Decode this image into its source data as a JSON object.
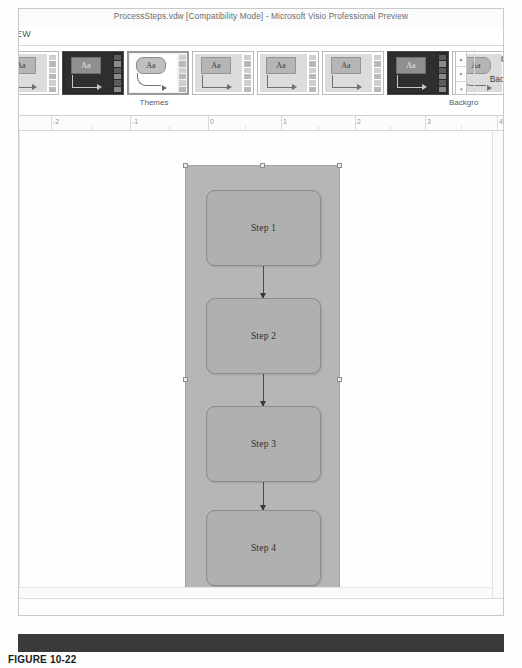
{
  "window": {
    "title": "ProcessSteps.vdw  [Compatibility Mode] - Microsoft Visio Professional Preview",
    "active_tab": "IEW"
  },
  "ribbon": {
    "groups": [
      {
        "name": "themes",
        "label": "Themes"
      },
      {
        "name": "background",
        "label": "Backgro"
      }
    ],
    "themes_gallery": {
      "label": "Themes",
      "thumb_text": "Aa",
      "items": [
        {
          "name": "theme-partial-left",
          "style": "light",
          "selected": false
        },
        {
          "name": "theme-dark-1",
          "style": "dark",
          "selected": false
        },
        {
          "name": "theme-rounded-selected",
          "style": "selected",
          "selected": true
        },
        {
          "name": "theme-light-1",
          "style": "light",
          "selected": false
        },
        {
          "name": "theme-light-2",
          "style": "light",
          "selected": false
        },
        {
          "name": "theme-light-3",
          "style": "light",
          "selected": false
        },
        {
          "name": "theme-dark-2",
          "style": "dark",
          "selected": false
        },
        {
          "name": "theme-rounded-last",
          "style": "rounded",
          "selected": false
        }
      ],
      "scroll_buttons": [
        {
          "name": "gallery-scroll-up",
          "glyph": "▲"
        },
        {
          "name": "gallery-scroll-down",
          "glyph": "▼"
        },
        {
          "name": "gallery-more",
          "glyph": "▾"
        }
      ]
    },
    "background_button": {
      "label": "Background",
      "caret": "▾",
      "icon": "background-page-icon"
    }
  },
  "ruler": {
    "labels": [
      "-2",
      "-1",
      "0",
      "1",
      "2",
      "3",
      "4"
    ],
    "positions": [
      32,
      111,
      189,
      262,
      336,
      406,
      478
    ]
  },
  "canvas": {
    "container": {
      "name": "process-container-shape",
      "selected": true
    },
    "steps": [
      {
        "label": "Step 1",
        "top": 24
      },
      {
        "label": "Step 2",
        "top": 132
      },
      {
        "label": "Step 3",
        "top": 240
      },
      {
        "label": "Step 4",
        "top": 344
      }
    ],
    "connectors": [
      {
        "top": 100,
        "height": 32
      },
      {
        "top": 208,
        "height": 32
      },
      {
        "top": 316,
        "height": 28
      }
    ]
  },
  "caption": {
    "figure": "FIGURE 10-22"
  },
  "colors": {
    "container_fill": "#b6b6b6",
    "step_fill": "#b0b0b0",
    "step_border": "#8c8c8c",
    "connector": "#4a4a4a",
    "band": "#3a3a3a"
  }
}
